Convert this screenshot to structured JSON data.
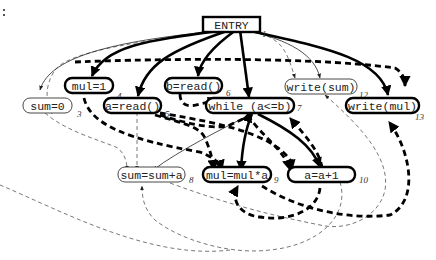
{
  "diagram": {
    "nodes": [
      {
        "id": 1,
        "text": "ENTRY",
        "label": "1",
        "style": "rect-bold"
      },
      {
        "id": 2,
        "text": "mul=1",
        "label": "4",
        "style": "round-bold"
      },
      {
        "id": 3,
        "text": "sum=0",
        "label": "3",
        "style": "round-thin"
      },
      {
        "id": 4,
        "text": "a=read()",
        "label": "5",
        "style": "round-bold"
      },
      {
        "id": 5,
        "text": "b=read()",
        "label": "6",
        "style": "round-bold"
      },
      {
        "id": 6,
        "text": "while (a<=b)",
        "label": "7",
        "style": "round-bold"
      },
      {
        "id": 7,
        "text": "write(sum)",
        "label": "12",
        "style": "round-thin"
      },
      {
        "id": 8,
        "text": "write(mul)",
        "label": "13",
        "style": "round-bold"
      },
      {
        "id": 9,
        "text": "sum=sum+a",
        "label": "8",
        "style": "round-thin"
      },
      {
        "id": 10,
        "text": "mul=mul*a",
        "label": "9",
        "style": "round-bold"
      },
      {
        "id": 11,
        "text": "a=a+1",
        "label": "10",
        "style": "round-bold"
      }
    ],
    "edge_types": {
      "control_bold": "solid thick",
      "data_bold": "dashed thick",
      "control_thin": "solid thin",
      "data_thin": "dashed thin"
    }
  }
}
